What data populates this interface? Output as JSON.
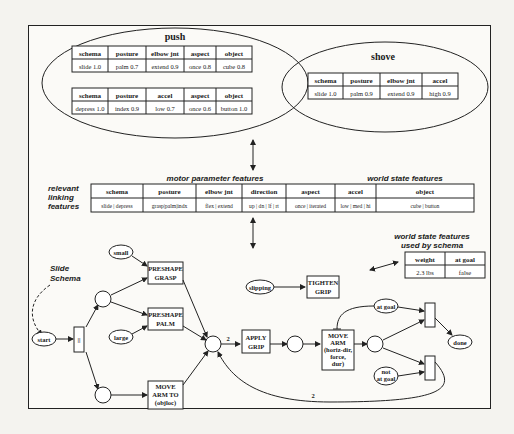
{
  "push": {
    "title": "push",
    "table1": {
      "headers": [
        "schema",
        "posture",
        "elbow jnt",
        "aspect",
        "object"
      ],
      "values": [
        "slide 1.0",
        "palm 0.7",
        "extend 0.9",
        "once 0.8",
        "cube 0.8"
      ]
    },
    "table2": {
      "headers": [
        "schema",
        "posture",
        "accel",
        "aspect",
        "object"
      ],
      "values": [
        "depress 1.0",
        "index 0.9",
        "low 0.7",
        "once 0.6",
        "button 1.0"
      ]
    }
  },
  "shove": {
    "title": "shove",
    "table": {
      "headers": [
        "schema",
        "posture",
        "elbow jnt",
        "accel"
      ],
      "values": [
        "slide 1.0",
        "palm 0.9",
        "extend 0.9",
        "high 0.9"
      ]
    }
  },
  "linking": {
    "label_lines": [
      "relevant",
      "linking",
      "features"
    ],
    "motor_label": "motor parameter features",
    "world_label": "world state features",
    "headers": [
      "schema",
      "posture",
      "elbow jnt",
      "direction",
      "aspect",
      "accel",
      "object"
    ],
    "values": [
      "slide | depress",
      "grasp|palm|indx",
      "flex | extend",
      "up | dn | lf | rt",
      "once | iterated",
      "low | med | hi",
      "cube | button"
    ]
  },
  "world_state": {
    "label_lines": [
      "world state features",
      "used by schema"
    ],
    "headers": [
      "weight",
      "at goal"
    ],
    "values": [
      "2.3 lbs",
      "false"
    ]
  },
  "schema_net": {
    "schema_label_lines": [
      "Slide",
      "Schema"
    ],
    "nodes": {
      "start": "start",
      "small": "small",
      "large": "large",
      "slipping": "slipping",
      "at_goal": "at goal",
      "not_at_goal_1": "not",
      "not_at_goal_2": "at goal",
      "done": "done",
      "parallel": "||"
    },
    "actions": {
      "preshape_grasp": [
        "PRESHAPE",
        "GRASP"
      ],
      "preshape_palm": [
        "PRESHAPE",
        "PALM"
      ],
      "move_arm_to": [
        "MOVE",
        "ARM TO",
        "(objloc)"
      ],
      "apply_grip": [
        "APPLY",
        "GRIP"
      ],
      "tighten_grip": [
        "TIGHTEN",
        "GRIP"
      ],
      "move_arm": [
        "MOVE",
        "ARM",
        "(horiz-dir,",
        "force,",
        "dur)"
      ]
    },
    "arc_weights": {
      "to_apply_grip": "2",
      "loop_back": "2"
    }
  }
}
